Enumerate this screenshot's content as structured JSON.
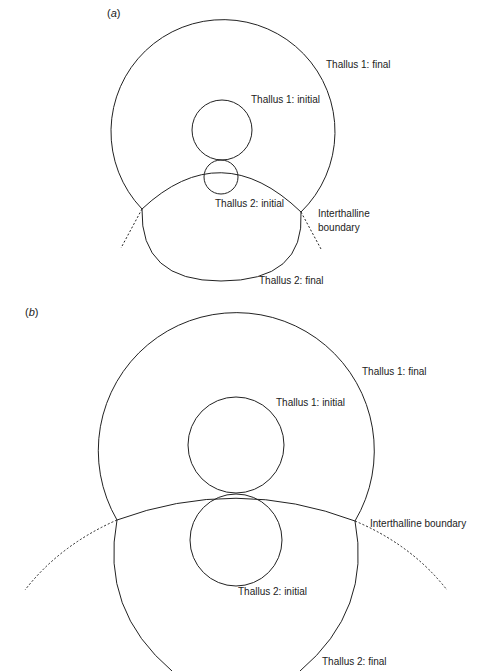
{
  "panels": [
    {
      "id": "a",
      "label_open": "(",
      "label_letter": "a",
      "label_close": ")",
      "labels": {
        "thallus1_final": "Thallus 1: final",
        "thallus1_initial": "Thallus 1: initial",
        "thallus2_initial": "Thallus 2: initial",
        "interthalline_line1": "Interthalline",
        "interthalline_line2": "boundary",
        "thallus2_final": "Thallus 2: final"
      }
    },
    {
      "id": "b",
      "label_open": "(",
      "label_letter": "b",
      "label_close": ")",
      "labels": {
        "thallus1_final": "Thallus 1: final",
        "thallus1_initial": "Thallus 1: initial",
        "interthalline": "Interthalline boundary",
        "thallus2_initial": "Thallus 2: initial",
        "thallus2_final": "Thallus 2: final"
      }
    }
  ],
  "colors": {
    "stroke": "#222222",
    "background": "#ffffff"
  }
}
